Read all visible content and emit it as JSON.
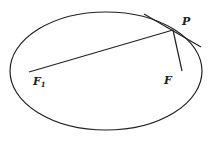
{
  "diagram": {
    "ellipse": {
      "cx": 106,
      "cy": 71,
      "rx": 96,
      "ry": 59
    },
    "points": {
      "P": {
        "x": 173,
        "y": 30
      },
      "F1": {
        "x": 29,
        "y": 72
      },
      "F": {
        "x": 182,
        "y": 71
      }
    },
    "tangent": {
      "x1": 144,
      "y1": 14,
      "x2": 201,
      "y2": 47
    },
    "labels": {
      "P": "P",
      "F1_main": "F",
      "F1_sub": "1",
      "F": "F"
    },
    "stroke_color": "#222222"
  }
}
